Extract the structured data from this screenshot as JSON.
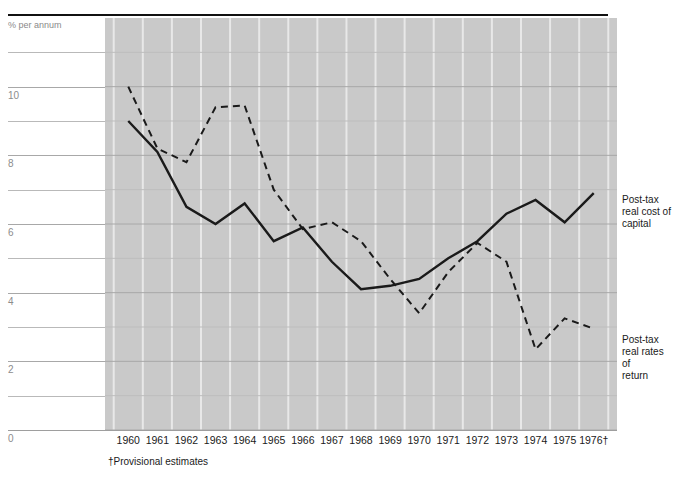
{
  "figure": {
    "title": "",
    "footnote": "†Provisional estimates",
    "y_axis_title": "% per annum"
  },
  "annotations": {
    "cost_of_capital": "Post-tax\nreal cost of\ncapital",
    "cost_of_capital_lines": [
      "Post-tax",
      "real cost of",
      "capital"
    ],
    "rates_of_return": "Post-tax\nreal rates of\nreturn",
    "rates_of_return_lines": [
      "Post-tax",
      "real rates of",
      "return"
    ]
  },
  "colors": {
    "plot_background": "#c9c9c9",
    "vertical_gridline": "#e8e8e8",
    "horizontal_gridline_major": "#a8a8a8",
    "horizontal_gridline_minor": "#bdbdbd",
    "series_line": "#1a1a1a",
    "axis_text": "#1a1a1a",
    "tick_text": "#8c8c8c",
    "top_rule": "#111111"
  },
  "chart_data": {
    "type": "line",
    "title": "",
    "xlabel": "",
    "ylabel": "% per annum",
    "ylim": [
      0,
      12
    ],
    "yticks": [
      0,
      2,
      4,
      6,
      8,
      10
    ],
    "ytick_labels": [
      "0",
      "2",
      "4",
      "6",
      "8",
      "10"
    ],
    "y_minor_gridlines": [
      1,
      3,
      5,
      7,
      9,
      11
    ],
    "grid": true,
    "legend_position": "right-inline-annotations",
    "x": [
      1960,
      1961,
      1962,
      1963,
      1964,
      1965,
      1966,
      1967,
      1968,
      1969,
      1970,
      1971,
      1972,
      1973,
      1974,
      1975,
      1976
    ],
    "xtick_labels": [
      "1960",
      "1961",
      "1962",
      "1963",
      "1964",
      "1965",
      "1966",
      "1967",
      "1968",
      "1969",
      "1970",
      "1971",
      "1972",
      "1973",
      "1974",
      "1975",
      "1976†"
    ],
    "series": [
      {
        "name": "Post-tax real cost of capital",
        "style": "solid",
        "values": [
          9.0,
          8.1,
          6.5,
          6.0,
          6.6,
          5.5,
          5.9,
          4.9,
          4.1,
          4.2,
          4.4,
          5.0,
          5.5,
          6.3,
          6.7,
          6.05,
          6.9
        ]
      },
      {
        "name": "Post-tax real rates of return",
        "style": "dashed",
        "values": [
          10.0,
          8.2,
          7.8,
          9.4,
          9.45,
          7.0,
          5.85,
          6.05,
          5.5,
          4.4,
          3.4,
          4.6,
          5.45,
          4.9,
          2.35,
          3.25,
          2.95
        ]
      }
    ]
  }
}
